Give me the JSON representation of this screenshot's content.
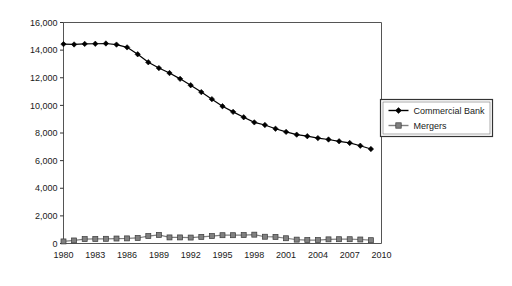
{
  "chart_data": {
    "type": "line",
    "title": "",
    "subtitle": "",
    "xlabel": "",
    "ylabel": "",
    "xlim": [
      1980,
      2010
    ],
    "ylim": [
      0,
      16000
    ],
    "grid": false,
    "legend_position": "right",
    "x": [
      1980,
      1981,
      1982,
      1983,
      1984,
      1985,
      1986,
      1987,
      1988,
      1989,
      1990,
      1991,
      1992,
      1993,
      1994,
      1995,
      1996,
      1997,
      1998,
      1999,
      2000,
      2001,
      2002,
      2003,
      2004,
      2005,
      2006,
      2007,
      2008,
      2009
    ],
    "xticks": [
      1980,
      1983,
      1986,
      1989,
      1992,
      1995,
      1998,
      2001,
      2004,
      2007,
      2010
    ],
    "xtick_labels": [
      "1980",
      "1983",
      "1986",
      "1989",
      "1992",
      "1995",
      "1998",
      "2001",
      "2004",
      "2007",
      "2010"
    ],
    "yticks": [
      0,
      2000,
      4000,
      6000,
      8000,
      10000,
      12000,
      14000,
      16000
    ],
    "ytick_labels": [
      "0",
      "2,000",
      "4,000",
      "6,000",
      "8,000",
      "10,000",
      "12,000",
      "14,000",
      "16,000"
    ],
    "series": [
      {
        "name": "Commercial Bank",
        "color": "#000000",
        "marker": "diamond",
        "values": [
          14435,
          14410,
          14450,
          14460,
          14480,
          14400,
          14200,
          13700,
          13120,
          12700,
          12340,
          11920,
          11460,
          10960,
          10450,
          9940,
          9530,
          9140,
          8770,
          8580,
          8310,
          8080,
          7880,
          7770,
          7630,
          7530,
          7400,
          7280,
          7080,
          6840
        ]
      },
      {
        "name": "Mergers",
        "color": "#808080",
        "marker": "square",
        "values": [
          150,
          220,
          320,
          330,
          340,
          360,
          370,
          400,
          540,
          620,
          440,
          440,
          430,
          480,
          540,
          600,
          600,
          610,
          640,
          490,
          480,
          380,
          280,
          250,
          250,
          300,
          310,
          310,
          290,
          240
        ]
      }
    ]
  },
  "legend": {
    "items": [
      {
        "label": "Commercial Bank",
        "marker": "diamond",
        "color": "#000000"
      },
      {
        "label": "Mergers",
        "marker": "square",
        "color": "#808080"
      }
    ]
  }
}
